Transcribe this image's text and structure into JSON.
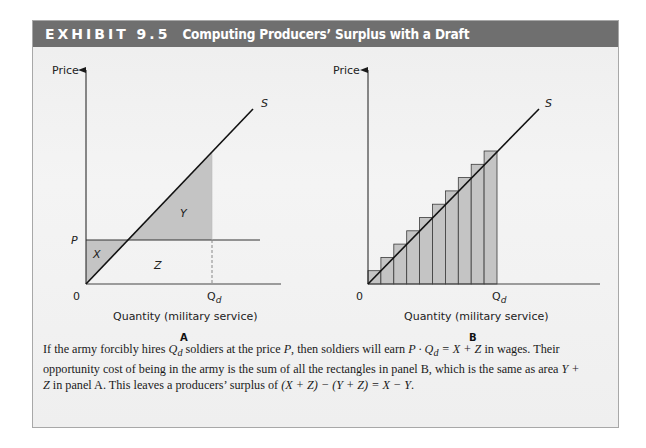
{
  "exhibit": {
    "number": "EXHIBIT 9.5",
    "title": "Computing Producers’ Surplus with a Draft"
  },
  "colors": {
    "header_bg": "#6f6f6f",
    "frame_bg": "#efefef",
    "shade": "#c4c4c4",
    "line": "#1a1a1a"
  },
  "panel_a": {
    "ylabel": "Price",
    "xlabel": "Quantity (military service)",
    "origin_label": "0",
    "price_label": "P",
    "qd_label": "Q",
    "qd_sub": "d",
    "supply_label": "S",
    "area_x": "X",
    "area_y": "Y",
    "area_z": "Z",
    "panel_label": "A"
  },
  "panel_b": {
    "ylabel": "Price",
    "xlabel": "Quantity (military service)",
    "origin_label": "0",
    "qd_label": "Q",
    "qd_sub": "d",
    "supply_label": "S",
    "panel_label": "B",
    "rectangles_count": 10
  },
  "caption": {
    "line1_a": "If the army forcibly hires ",
    "line1_qd": "Q",
    "line1_qd_sub": "d",
    "line1_b": " soldiers at the price ",
    "line1_p": "P",
    "line1_c": ", then soldiers will earn ",
    "line1_eq": "P · Q",
    "line1_eq_sub": "d",
    "line1_eq2": " = X + Z",
    "line1_d": " in wages. Their opportunity",
    "line2_a": "cost of being in the army is the sum of all the rectangles in panel B, which is the same as area ",
    "line2_yz": "Y + Z",
    "line2_b": " in panel A. This leaves",
    "line3_a": "a producers’ surplus of ",
    "line3_eq": "(X + Z) − (Y + Z) = X − Y",
    "line3_b": "."
  },
  "chart_data": [
    {
      "type": "line",
      "title": "Panel A",
      "xlabel": "Quantity (military service)",
      "ylabel": "Price",
      "series": [
        {
          "name": "S (supply)",
          "x": [
            0,
            1.2
          ],
          "y": [
            0,
            1.2
          ]
        },
        {
          "name": "P (draft price)",
          "x": [
            0,
            1.2
          ],
          "y": [
            0.3,
            0.3
          ]
        }
      ],
      "x_ticks": [
        "0",
        "Qd"
      ],
      "y_ticks": [
        "P"
      ],
      "annotations": [
        {
          "label": "X",
          "region": "triangle between P line and supply curve, left of intersection"
        },
        {
          "label": "Y",
          "region": "triangle between supply curve and P line, from intersection to Qd"
        },
        {
          "label": "Z",
          "region": "area under P line from intersection to Qd"
        }
      ],
      "grid": false
    },
    {
      "type": "bar",
      "title": "Panel B",
      "xlabel": "Quantity (military service)",
      "ylabel": "Price",
      "categories": [
        "1",
        "2",
        "3",
        "4",
        "5",
        "6",
        "7",
        "8",
        "9",
        "10"
      ],
      "values": [
        1,
        2,
        3,
        4,
        5,
        6,
        7,
        8,
        9,
        10
      ],
      "overlay_line": {
        "name": "S (supply)",
        "x": [
          0,
          13.2
        ],
        "y": [
          0,
          13.2
        ]
      },
      "x_ticks": [
        "0",
        "Qd"
      ],
      "grid": false
    }
  ]
}
